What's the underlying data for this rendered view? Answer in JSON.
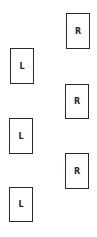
{
  "diagram": {
    "type": "footstep-sequence",
    "steps": [
      {
        "label": "R",
        "side": "right",
        "x": 66,
        "y": 13,
        "w": 24,
        "h": 36
      },
      {
        "label": "L",
        "side": "left",
        "x": 10,
        "y": 48,
        "w": 24,
        "h": 36
      },
      {
        "label": "R",
        "side": "right",
        "x": 65,
        "y": 84,
        "w": 24,
        "h": 35
      },
      {
        "label": "L",
        "side": "left",
        "x": 9,
        "y": 118,
        "w": 24,
        "h": 36
      },
      {
        "label": "R",
        "side": "right",
        "x": 65,
        "y": 153,
        "w": 24,
        "h": 36
      },
      {
        "label": "L",
        "side": "left",
        "x": 9,
        "y": 187,
        "w": 24,
        "h": 35
      }
    ]
  }
}
